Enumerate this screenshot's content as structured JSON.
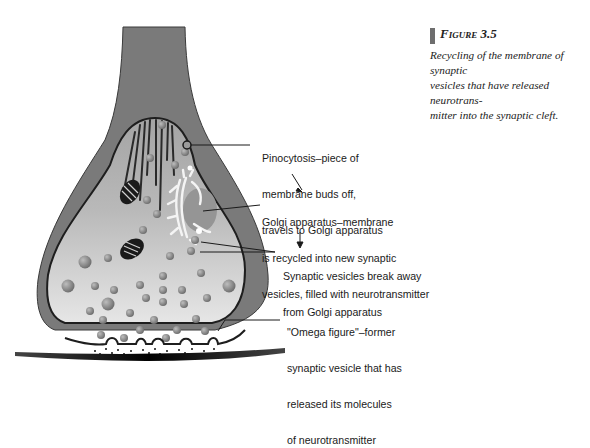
{
  "figure": {
    "number_label": "Figure 3.5",
    "caption": "Recycling of the membrane of synaptic vesicles that have released neurotransmitter into the synaptic cleft.",
    "caption_lines": [
      "Recycling of the membrane of synaptic",
      "vesicles that have released neurotrans-",
      "mitter into the synaptic cleft."
    ],
    "accent_bar_color": "#6e6e6e"
  },
  "diagram": {
    "colors": {
      "axon_outer": "#7a7a7a",
      "terminal_interior_top": "#a9a9a9",
      "terminal_interior_bottom": "#e2e2e2",
      "membrane_line": "#1e1e1e",
      "vesicle": "#8a8a8a",
      "postsynaptic_membrane": "#1a1a1a"
    },
    "labels": [
      {
        "id": "pinocytosis",
        "lines": [
          "Pinocytosis–piece of",
          "membrane buds off,",
          "travels to Golgi apparatus"
        ]
      },
      {
        "id": "golgi",
        "lines": [
          "Golgi apparatus–membrane",
          "is recycled into new synaptic",
          "vesicles, filled with neurotransmitter"
        ]
      },
      {
        "id": "vesicles-break-away",
        "lines": [
          "Synaptic vesicles break away",
          "from Golgi apparatus"
        ]
      },
      {
        "id": "omega-figure",
        "lines": [
          "\"Omega figure\"–former",
          "synaptic vesicle that has",
          "released its molecules",
          "of neurotransmitter"
        ]
      }
    ]
  }
}
